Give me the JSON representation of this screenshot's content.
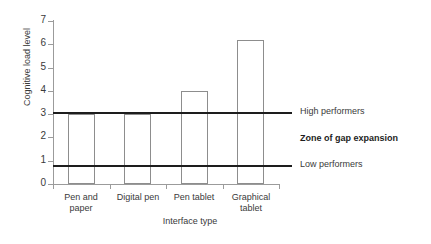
{
  "chart_data": {
    "type": "bar",
    "title": "",
    "xlabel": "Interface type",
    "ylabel": "Cognitive load level",
    "categories": [
      "Pen and paper",
      "Digital pen",
      "Pen tablet",
      "Graphical tablet"
    ],
    "category_lines": [
      [
        "Pen and",
        "paper"
      ],
      [
        "Digital pen",
        ""
      ],
      [
        "Pen tablet",
        ""
      ],
      [
        "Graphical",
        "tablet"
      ]
    ],
    "values": [
      3,
      3,
      4,
      6.2
    ],
    "ylim": [
      0,
      7
    ],
    "yticks": [
      0,
      1,
      2,
      3,
      4,
      5,
      6,
      7
    ],
    "ytick_labels": [
      "0",
      "1",
      "2",
      "3",
      "4",
      "5",
      "6",
      "7"
    ],
    "grid": false,
    "legend_position": "right",
    "reference_lines": [
      {
        "label": "High performers",
        "value": 3.1
      },
      {
        "label": "Low performers",
        "value": 0.8
      }
    ],
    "annotations": [
      {
        "text": "Zone of gap expansion",
        "bold": true,
        "value": 1.95
      }
    ],
    "colors": {
      "bar_fill": "#ffffff",
      "bar_border": "#8d8d8d",
      "axis": "#9b9b9b",
      "reference_line": "#1d1d1d",
      "text": "#3a3a3a",
      "background": "#ffffff"
    }
  }
}
